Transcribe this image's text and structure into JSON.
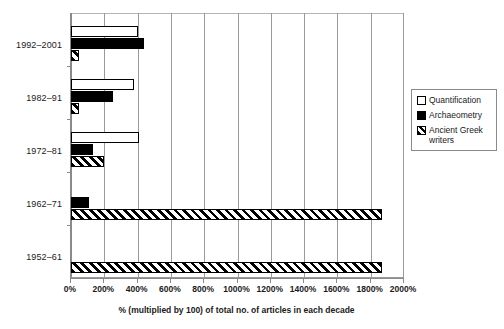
{
  "chart_data": {
    "type": "bar",
    "orientation": "horizontal",
    "title": "",
    "subtitle": "",
    "xlabel": "% (multiplied by 100) of total no. of articles in each decade",
    "ylabel": "",
    "categories": [
      "1992–2001",
      "1982–91",
      "1972–81",
      "1962–71",
      "1952–61"
    ],
    "series": [
      {
        "name": "Quantification",
        "values": [
          400,
          380,
          410,
          0,
          0
        ]
      },
      {
        "name": "Archaeometry",
        "values": [
          440,
          250,
          130,
          110,
          0
        ]
      },
      {
        "name": "Ancient Greek writers",
        "values": [
          50,
          50,
          200,
          1870,
          1870
        ]
      }
    ],
    "xlim": [
      0,
      2000
    ],
    "xticks": [
      0,
      200,
      400,
      600,
      800,
      1000,
      1200,
      1400,
      1600,
      1800,
      2000
    ],
    "xticklabels": [
      "0%",
      "200%",
      "400%",
      "600%",
      "800%",
      "1000%",
      "1200%",
      "1400%",
      "1600%",
      "1800%",
      "2000%"
    ],
    "grid": "vertical",
    "legend_position": "right",
    "colors": {
      "quantification": "#ffffff",
      "archaeometry": "#000000",
      "ancient_greek_writers": "#ffffff",
      "bar_outline": "#000000",
      "grid": "#9a9a9a",
      "axis": "#8a8a8a",
      "background": "#ffffff",
      "text": "#1a1a1a"
    }
  },
  "legend": {
    "items": [
      {
        "label": "Quantification",
        "swatch": "open-square-swatch"
      },
      {
        "label": "Archaeometry",
        "swatch": "filled-square-swatch"
      },
      {
        "label": "Ancient Greek writers",
        "swatch": "hatched-square-swatch"
      }
    ]
  }
}
